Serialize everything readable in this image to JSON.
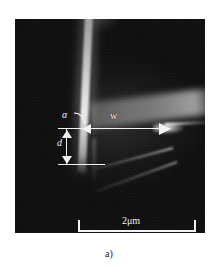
{
  "figure": {
    "caption": "a)",
    "panel_label": "a)"
  },
  "micrograph": {
    "type": "electron-micrograph",
    "background_color": "#0d0d0d",
    "annotation_color": "#f2f2f2",
    "description": "Dark grayscale electron micrograph of a crystal edge with a bright near-vertical ridge and a bright converging vertex at right"
  },
  "annotations": {
    "angle_label": "α",
    "width_label": "w",
    "depth_label": "d"
  },
  "scalebar": {
    "label": "2μm",
    "value": 2,
    "unit": "μm"
  }
}
